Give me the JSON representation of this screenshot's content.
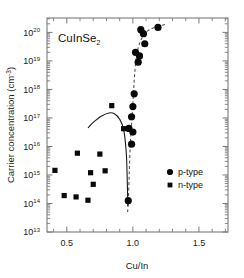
{
  "figure": {
    "annotation": "CuInSe",
    "annotation_subscript": "2",
    "background_color": "#ffffff",
    "frame_color": "#7a7a7a",
    "marker_color": "#0a0a0a"
  },
  "legend": {
    "position": "center-right",
    "entries": [
      {
        "label": "p-type",
        "marker": "filled-circle"
      },
      {
        "label": "n-type",
        "marker": "filled-square"
      }
    ]
  },
  "axes": {
    "x": {
      "label": "Cu/In",
      "tick_labels": [
        "0.5",
        "1.0",
        "1.5"
      ],
      "tick_values": [
        0.5,
        1.0,
        1.5
      ],
      "minor_step": 0.1,
      "range": [
        0.35,
        1.72
      ],
      "scale": "linear"
    },
    "y": {
      "label": "Carrier concentration (cm",
      "label_superscript": "-3",
      "label_suffix": ")",
      "tick_mantissa": "10",
      "tick_exponents": [
        "13",
        "14",
        "15",
        "16",
        "17",
        "18",
        "19",
        "20"
      ],
      "tick_values": [
        10000000000000.0,
        100000000000000.0,
        1000000000000000.0,
        1e+16,
        1e+17,
        1e+18,
        1e+19,
        1e+20
      ],
      "range": [
        10000000000000.0,
        3.2e+20
      ],
      "scale": "log"
    }
  },
  "chart_data": {
    "type": "scatter",
    "title": "CuInSe2",
    "xlabel": "Cu/In",
    "ylabel": "Carrier concentration (cm^-3)",
    "xlim": [
      0.35,
      1.72
    ],
    "ylim": [
      10000000000000.0,
      3.2e+20
    ],
    "xscale": "linear",
    "yscale": "log",
    "grid": false,
    "legend_position": "center-right",
    "series": [
      {
        "name": "p-type",
        "marker": "filled-circle",
        "color": "#0a0a0a",
        "points": [
          {
            "x": 1.19,
            "y": 1.5e+20
          },
          {
            "x": 1.06,
            "y": 1.25e+20
          },
          {
            "x": 1.08,
            "y": 9e+19
          },
          {
            "x": 1.09,
            "y": 4e+19
          },
          {
            "x": 1.02,
            "y": 2e+19
          },
          {
            "x": 1.05,
            "y": 1.5e+19
          },
          {
            "x": 1.04,
            "y": 9e+18
          },
          {
            "x": 1.01,
            "y": 7e+17
          },
          {
            "x": 1.0,
            "y": 2.5e+17
          },
          {
            "x": 0.99,
            "y": 1.1e+17
          },
          {
            "x": 0.97,
            "y": 4.3e+16
          },
          {
            "x": 1.0,
            "y": 3.2e+16
          },
          {
            "x": 0.99,
            "y": 1.2e+16
          },
          {
            "x": 0.965,
            "y": 125000000000000.0
          }
        ]
      },
      {
        "name": "n-type",
        "marker": "filled-square",
        "color": "#0a0a0a",
        "points": [
          {
            "x": 0.84,
            "y": 2.7e+17
          },
          {
            "x": 0.93,
            "y": 4.2e+16
          },
          {
            "x": 0.58,
            "y": 5800000000000000.0
          },
          {
            "x": 0.75,
            "y": 5400000000000000.0
          },
          {
            "x": 0.41,
            "y": 1450000000000000.0
          },
          {
            "x": 0.68,
            "y": 1200000000000000.0
          },
          {
            "x": 0.79,
            "y": 1400000000000000.0
          },
          {
            "x": 0.7,
            "y": 470000000000000.0
          },
          {
            "x": 0.48,
            "y": 190000000000000.0
          },
          {
            "x": 0.57,
            "y": 170000000000000.0
          },
          {
            "x": 0.66,
            "y": 130000000000000.0
          }
        ]
      }
    ],
    "curves": [
      {
        "name": "p-type-trend",
        "style": "dashed",
        "color": "#555555",
        "points": [
          {
            "x": 0.96,
            "y": 50000000000000.0
          },
          {
            "x": 0.966,
            "y": 130000000000000.0
          },
          {
            "x": 0.972,
            "y": 1000000000000000.0
          },
          {
            "x": 0.98,
            "y": 1e+16
          },
          {
            "x": 0.99,
            "y": 6e+16
          },
          {
            "x": 1.0,
            "y": 3e+17
          },
          {
            "x": 1.01,
            "y": 2e+18
          },
          {
            "x": 1.025,
            "y": 1.2e+19
          },
          {
            "x": 1.05,
            "y": 4e+19
          },
          {
            "x": 1.09,
            "y": 9e+19
          },
          {
            "x": 1.15,
            "y": 1.4e+20
          },
          {
            "x": 1.26,
            "y": 2e+20
          }
        ]
      },
      {
        "name": "n-type-trend",
        "style": "solid",
        "color": "#1a1a1a",
        "points": [
          {
            "x": 0.66,
            "y": 4.5e+16
          },
          {
            "x": 0.7,
            "y": 7e+16
          },
          {
            "x": 0.76,
            "y": 1.15e+17
          },
          {
            "x": 0.82,
            "y": 1.5e+17
          },
          {
            "x": 0.86,
            "y": 1.4e+17
          },
          {
            "x": 0.9,
            "y": 9e+16
          },
          {
            "x": 0.93,
            "y": 4e+16
          },
          {
            "x": 0.95,
            "y": 6000000000000000.0
          },
          {
            "x": 0.958,
            "y": 500000000000000.0
          },
          {
            "x": 0.962,
            "y": 80000000000000.0
          }
        ]
      }
    ]
  }
}
